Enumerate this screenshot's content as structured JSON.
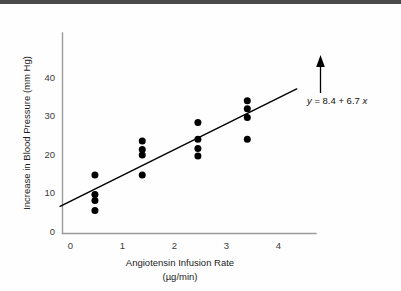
{
  "figure": {
    "background_color": "#fefefe",
    "axis_color": "#9a9a9a",
    "point_color": "#000000",
    "line_color": "#000000"
  },
  "annotation": {
    "equation_y": "y",
    "equation_body": " = 8.4 + 6.7 ",
    "equation_x": "x",
    "arrow_name": "annotation-arrow"
  },
  "axes": {
    "x_title_line1": "Angiotensin Infusion Rate",
    "x_title_line2": "(µg/min)",
    "y_title": "Increase in Blood Pressure (mm Hg)",
    "x_ticks": [
      "0",
      "1",
      "2",
      "3",
      "4"
    ],
    "y_ticks": [
      "0",
      "10",
      "20",
      "30",
      "40"
    ]
  },
  "chart_data": {
    "type": "scatter",
    "title": "",
    "xlabel": "Angiotensin Infusion Rate (µg/min)",
    "ylabel": "Increase in Blood Pressure (mm Hg)",
    "xlim": [
      -0.2,
      4.6
    ],
    "ylim": [
      0,
      42
    ],
    "xticks": [
      0,
      1,
      2,
      3,
      4
    ],
    "yticks": [
      0,
      10,
      20,
      30,
      40
    ],
    "grid": false,
    "legend": null,
    "points": [
      {
        "x": 0.47,
        "y": 15.2
      },
      {
        "x": 0.47,
        "y": 10.1
      },
      {
        "x": 0.47,
        "y": 8.6
      },
      {
        "x": 0.47,
        "y": 6.0
      },
      {
        "x": 1.38,
        "y": 24.0
      },
      {
        "x": 1.38,
        "y": 21.8
      },
      {
        "x": 1.38,
        "y": 20.4
      },
      {
        "x": 1.38,
        "y": 15.2
      },
      {
        "x": 2.45,
        "y": 28.8
      },
      {
        "x": 2.45,
        "y": 24.5
      },
      {
        "x": 2.45,
        "y": 22.1
      },
      {
        "x": 2.45,
        "y": 20.1
      },
      {
        "x": 3.4,
        "y": 34.5
      },
      {
        "x": 3.4,
        "y": 32.4
      },
      {
        "x": 3.4,
        "y": 30.1
      },
      {
        "x": 3.4,
        "y": 24.5
      }
    ],
    "fit_line": {
      "label": "y = 8.4 + 6.7 x",
      "intercept": 8.4,
      "slope": 6.7,
      "x_start": -0.2,
      "x_end": 4.35
    },
    "annotations": [
      {
        "text": "y = 8.4 + 6.7 x",
        "x": 4.35,
        "y": 27.0,
        "arrow_to_x": 4.35,
        "arrow_to_y": 37.5
      }
    ]
  }
}
